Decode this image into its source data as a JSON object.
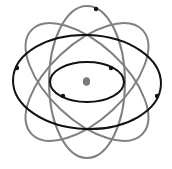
{
  "diagram": {
    "type": "atom-model",
    "width": 172,
    "height": 169,
    "center": {
      "x": 87,
      "y": 82
    },
    "colors": {
      "background": "#ffffff",
      "outer_orbit": "#808080",
      "inner_orbit": "#111111",
      "nucleus": "#7a7a7a",
      "electron": "#111111"
    },
    "nucleus": {
      "rx": 3.6,
      "ry": 4.3
    },
    "gray_orbits": [
      {
        "name": "vertical-orbit",
        "rx": 38,
        "ry": 76,
        "rotation": 0
      },
      {
        "name": "tilted-orbit-left",
        "rx": 38,
        "ry": 76,
        "rotation": -47
      },
      {
        "name": "tilted-orbit-right",
        "rx": 38,
        "ry": 76,
        "rotation": 47
      }
    ],
    "black_orbits": [
      {
        "name": "outer-horizontal-orbit",
        "rx": 74,
        "ry": 47,
        "rotation": 2
      },
      {
        "name": "inner-horizontal-orbit",
        "rx": 37,
        "ry": 20,
        "rotation": 0
      }
    ],
    "electrons": [
      {
        "name": "electron-top",
        "x": 96,
        "y": 9
      },
      {
        "name": "electron-outer-left",
        "x": 17,
        "y": 68
      },
      {
        "name": "electron-outer-right",
        "x": 157,
        "y": 96
      },
      {
        "name": "electron-inner-upper-right",
        "x": 111,
        "y": 68
      },
      {
        "name": "electron-inner-lower-left",
        "x": 63,
        "y": 96
      }
    ],
    "stroke_width": 2,
    "electron_radius": 2.2
  }
}
